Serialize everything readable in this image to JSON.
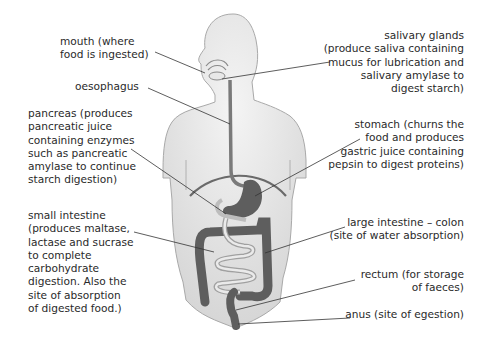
{
  "diagram": {
    "colors": {
      "body": "#dcdcdc",
      "body_outline": "#a9a9a9",
      "organ": "#5e5e5e",
      "small_intestine": "#c8c8c8",
      "line": "#333333",
      "text": "#2a2a2a"
    },
    "labels": {
      "mouth": "mouth (where\nfood is ingested)",
      "oesophagus": "oesophagus",
      "pancreas": "pancreas (produces\npancreatic juice\ncontaining enzymes\nsuch as pancreatic\namylase to continue\nstarch digestion)",
      "small_intestine": "small intestine\n(produces maltase,\nlactase and sucrase\nto complete\ncarbohydrate\ndigestion. Also the\nsite of absorption\nof digested food.)",
      "salivary_glands": "salivary glands\n(produce saliva containing\nmucus for lubrication and\nsalivary amylase to\ndigest starch)",
      "stomach": "stomach (churns the\nfood and produces\ngastric juice containing\npepsin to digest proteins)",
      "large_intestine": "large intestine – colon\n(site of water absorption)",
      "rectum": "rectum (for storage\nof faeces)",
      "anus": "anus (site of egestion)"
    }
  }
}
